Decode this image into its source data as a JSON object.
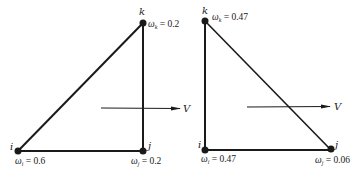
{
  "diagrams": [
    {
      "name": "left-triangle",
      "nodes": {
        "i": {
          "label": "i",
          "weight_symbol": "ω",
          "weight_sub": "i",
          "weight_text": " = 0.6"
        },
        "j": {
          "label": "j",
          "weight_symbol": "ω",
          "weight_sub": "j",
          "weight_text": " = 0.2"
        },
        "k": {
          "label": "k",
          "weight_symbol": "ω",
          "weight_sub": "k",
          "weight_text": " = 0.2"
        }
      },
      "velocity_label": "V"
    },
    {
      "name": "right-triangle",
      "nodes": {
        "i": {
          "label": "i",
          "weight_symbol": "ω",
          "weight_sub": "i",
          "weight_text": " = 0.47"
        },
        "j": {
          "label": "j",
          "weight_symbol": "ω",
          "weight_sub": "j",
          "weight_text": " = 0.06"
        },
        "k": {
          "label": "k",
          "weight_symbol": "ω",
          "weight_sub": "k",
          "weight_text": " = 0.47"
        }
      },
      "velocity_label": "V"
    }
  ],
  "colors": {
    "stroke": "#1a1a1a",
    "background": "#ffffff"
  }
}
